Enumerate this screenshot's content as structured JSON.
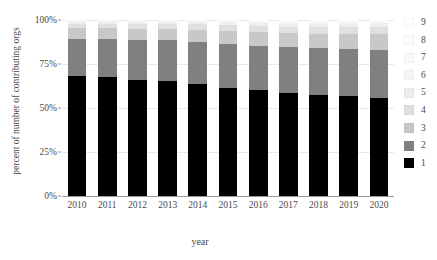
{
  "chart_data": {
    "type": "bar",
    "stacked": true,
    "normalized": true,
    "title": "",
    "xlabel": "year",
    "ylabel": "percent of number of contributing orgs",
    "categories": [
      "2010",
      "2011",
      "2012",
      "2013",
      "2014",
      "2015",
      "2016",
      "2017",
      "2018",
      "2019",
      "2020"
    ],
    "ylim": [
      0,
      100
    ],
    "yticks": [
      0,
      25,
      50,
      75,
      100
    ],
    "ytick_labels": [
      "0%",
      "25%",
      "50%",
      "75%",
      "100%"
    ],
    "grid": true,
    "legend_position": "right",
    "legend_title": "",
    "series": [
      {
        "name": "1",
        "color": "#000000",
        "values": [
          68.0,
          67.5,
          66.0,
          65.5,
          63.5,
          61.5,
          60.0,
          58.5,
          57.5,
          57.0,
          55.5
        ]
      },
      {
        "name": "2",
        "color": "#808080",
        "values": [
          21.0,
          21.5,
          22.5,
          23.0,
          24.0,
          25.0,
          25.5,
          26.0,
          26.5,
          26.5,
          27.5
        ]
      },
      {
        "name": "3",
        "color": "#c8c8c8",
        "values": [
          6.5,
          6.5,
          6.5,
          6.5,
          7.0,
          7.5,
          7.5,
          8.0,
          8.0,
          8.5,
          9.0
        ]
      },
      {
        "name": "4",
        "color": "#e0e0e0",
        "values": [
          2.5,
          2.5,
          2.8,
          2.8,
          3.0,
          3.2,
          3.5,
          3.5,
          3.8,
          3.8,
          4.0
        ]
      },
      {
        "name": "5",
        "color": "#eeeeee",
        "values": [
          1.0,
          1.1,
          1.2,
          1.2,
          1.4,
          1.5,
          1.7,
          1.8,
          1.9,
          2.0,
          2.1
        ]
      },
      {
        "name": "6",
        "color": "#f5f5f5",
        "values": [
          0.5,
          0.5,
          0.5,
          0.6,
          0.6,
          0.7,
          0.8,
          0.9,
          0.9,
          1.0,
          1.0
        ]
      },
      {
        "name": "7",
        "color": "#f9f9f9",
        "values": [
          0.3,
          0.3,
          0.3,
          0.3,
          0.3,
          0.3,
          0.4,
          0.5,
          0.6,
          0.6,
          0.5
        ]
      },
      {
        "name": "8",
        "color": "#fcfcfc",
        "values": [
          0.1,
          0.1,
          0.1,
          0.1,
          0.1,
          0.2,
          0.3,
          0.4,
          0.4,
          0.3,
          0.2
        ]
      },
      {
        "name": "9",
        "color": "#fefefe",
        "values": [
          0.1,
          0.0,
          0.1,
          0.0,
          0.1,
          0.1,
          0.3,
          0.4,
          0.4,
          0.3,
          0.2
        ]
      }
    ],
    "legend_entries": [
      {
        "label": "9",
        "color": "#fefefe"
      },
      {
        "label": "8",
        "color": "#fcfcfc"
      },
      {
        "label": "7",
        "color": "#f9f9f9"
      },
      {
        "label": "6",
        "color": "#f5f5f5"
      },
      {
        "label": "5",
        "color": "#eeeeee"
      },
      {
        "label": "4",
        "color": "#e0e0e0"
      },
      {
        "label": "3",
        "color": "#c8c8c8"
      },
      {
        "label": "2",
        "color": "#808080"
      },
      {
        "label": "1",
        "color": "#000000"
      }
    ]
  }
}
